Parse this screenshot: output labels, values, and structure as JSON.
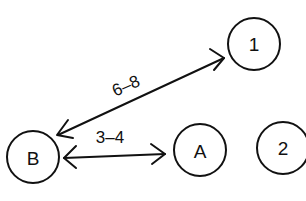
{
  "diagram": {
    "type": "node-link",
    "nodes": [
      {
        "id": "1",
        "label": "1",
        "cx": 254,
        "cy": 44,
        "r": 26
      },
      {
        "id": "B",
        "label": "B",
        "cx": 33,
        "cy": 157,
        "r": 26
      },
      {
        "id": "A",
        "label": "A",
        "cx": 200,
        "cy": 150,
        "r": 26
      },
      {
        "id": "2",
        "label": "2",
        "cx": 283,
        "cy": 148,
        "r": 26
      }
    ],
    "edges": [
      {
        "from": "B",
        "to": "1",
        "label": "6–8",
        "bidirectional": true
      },
      {
        "from": "B",
        "to": "A",
        "label": "3–4",
        "bidirectional": true
      }
    ],
    "colors": {
      "stroke": "#111111",
      "background": "#ffffff"
    }
  }
}
